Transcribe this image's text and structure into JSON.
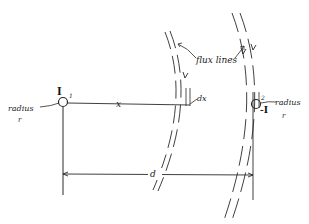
{
  "diagram": {
    "type": "two-wire conductor flux linkage",
    "conductor_1": {
      "current_label": "I",
      "index_label": "1",
      "radius_label": "radius",
      "radius_symbol": "r"
    },
    "conductor_2": {
      "current_label": "-I",
      "index_label": "2",
      "radius_label": "radius",
      "radius_symbol": "r"
    },
    "distance_label": "x",
    "differential_label": "dx",
    "separation_label": "d",
    "flux_label": "flux lines"
  }
}
